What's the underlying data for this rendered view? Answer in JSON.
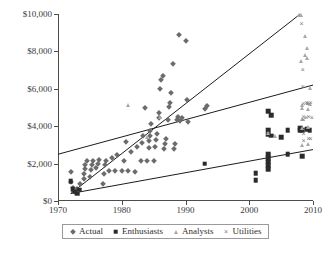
{
  "chart_data": {
    "type": "scatter",
    "title": "",
    "xlabel": "",
    "ylabel": "",
    "xlim": [
      1970,
      2010
    ],
    "ylim": [
      0,
      10000
    ],
    "xticks": [
      "1970",
      "1980",
      "1990",
      "2000",
      "2010"
    ],
    "yticks": [
      "$0",
      "$2,000",
      "$4,000",
      "$6,000",
      "$8,000",
      "$10,000"
    ],
    "xtick_values": [
      1970,
      1980,
      1990,
      2000,
      2010
    ],
    "ytick_values": [
      0,
      2000,
      4000,
      6000,
      8000,
      10000
    ],
    "grid": false,
    "legend_position": "bottom",
    "series": [
      {
        "name": "Actual",
        "marker": "diamond",
        "color": "#6b6b6b",
        "points": [
          [
            1972,
            1550
          ],
          [
            1972,
            1000
          ],
          [
            1972.4,
            700
          ],
          [
            1972.6,
            500
          ],
          [
            1973,
            620
          ],
          [
            1973.4,
            900
          ],
          [
            1974,
            1150
          ],
          [
            1974,
            1450
          ],
          [
            1974.2,
            1700
          ],
          [
            1974.3,
            1950
          ],
          [
            1974.5,
            2150
          ],
          [
            1975,
            1300
          ],
          [
            1975.2,
            1650
          ],
          [
            1975.4,
            1900
          ],
          [
            1975.5,
            2150
          ],
          [
            1976,
            1750
          ],
          [
            1976.2,
            2000
          ],
          [
            1976.4,
            2200
          ],
          [
            1977,
            900
          ],
          [
            1977.2,
            1450
          ],
          [
            1977.4,
            1900
          ],
          [
            1977.5,
            2150
          ],
          [
            1978,
            1600
          ],
          [
            1978.5,
            2300
          ],
          [
            1979,
            1600
          ],
          [
            1979.3,
            2450
          ],
          [
            1980,
            1600
          ],
          [
            1980.4,
            2150
          ],
          [
            1980.6,
            3150
          ],
          [
            1981,
            1600
          ],
          [
            1981.5,
            2600
          ],
          [
            1982,
            1550
          ],
          [
            1982.4,
            2900
          ],
          [
            1983,
            2150
          ],
          [
            1983.2,
            3100
          ],
          [
            1983.4,
            3450
          ],
          [
            1983.6,
            5000
          ],
          [
            1984,
            2150
          ],
          [
            1984.2,
            2850
          ],
          [
            1984.3,
            3200
          ],
          [
            1984.4,
            3500
          ],
          [
            1984.5,
            3750
          ],
          [
            1984.6,
            4100
          ],
          [
            1985,
            2150
          ],
          [
            1985.2,
            2900
          ],
          [
            1985.4,
            3250
          ],
          [
            1985.6,
            3600
          ],
          [
            1985.8,
            4450
          ],
          [
            1985.9,
            4700
          ],
          [
            1986,
            6000
          ],
          [
            1986.2,
            6450
          ],
          [
            1986.4,
            6700
          ],
          [
            1986.6,
            2800
          ],
          [
            1986.8,
            3050
          ],
          [
            1987,
            3300
          ],
          [
            1987.2,
            4350
          ],
          [
            1987.4,
            5050
          ],
          [
            1987.6,
            5250
          ],
          [
            1987.8,
            5750
          ],
          [
            1988,
            7300
          ],
          [
            1988.2,
            2800
          ],
          [
            1988.4,
            3050
          ],
          [
            1988.6,
            4350
          ],
          [
            1988.8,
            4500
          ],
          [
            1989,
            8900
          ],
          [
            1989.2,
            4300
          ],
          [
            1989.4,
            4450
          ],
          [
            1990,
            8550
          ],
          [
            1990.2,
            5400
          ],
          [
            1990.4,
            4200
          ],
          [
            1993,
            4900
          ],
          [
            1993.4,
            5100
          ]
        ]
      },
      {
        "name": "Enthusiasts",
        "marker": "square",
        "color": "#2b2b2b",
        "points": [
          [
            1972,
            1050
          ],
          [
            1972.3,
            620
          ],
          [
            1972.6,
            500
          ],
          [
            1973,
            400
          ],
          [
            1973.3,
            600
          ],
          [
            1993,
            2000
          ],
          [
            2001,
            1500
          ],
          [
            2001,
            1100
          ],
          [
            2003,
            4800
          ],
          [
            2003,
            3800
          ],
          [
            2003,
            3550
          ],
          [
            2003,
            2500
          ],
          [
            2003,
            2300
          ],
          [
            2003,
            2100
          ],
          [
            2003,
            1900
          ],
          [
            2003,
            1700
          ],
          [
            2003.4,
            4600
          ],
          [
            2003.4,
            3500
          ],
          [
            2005,
            3400
          ],
          [
            2006,
            3800
          ],
          [
            2006,
            2500
          ],
          [
            2008,
            3900
          ],
          [
            2008,
            3800
          ],
          [
            2008.3,
            3800
          ],
          [
            2008.3,
            2400
          ],
          [
            2009,
            3850
          ],
          [
            2009.5,
            3800
          ]
        ]
      },
      {
        "name": "Analysts",
        "marker": "triangle",
        "color": "#a8a8a8",
        "points": [
          [
            1981,
            5150
          ],
          [
            1984,
            3400
          ],
          [
            1986,
            4500
          ],
          [
            2003,
            3650
          ],
          [
            2004,
            3500
          ],
          [
            2007.8,
            9950
          ],
          [
            2008.1,
            9950
          ],
          [
            2008.1,
            7500
          ],
          [
            2008.3,
            5150
          ],
          [
            2008.3,
            4950
          ],
          [
            2008.3,
            4400
          ],
          [
            2008.3,
            3900
          ],
          [
            2008.3,
            3000
          ],
          [
            2008.8,
            8800
          ],
          [
            2008.8,
            7800
          ],
          [
            2009,
            8200
          ],
          [
            2009,
            7650
          ],
          [
            2009.2,
            5250
          ],
          [
            2009.2,
            4900
          ],
          [
            2009.2,
            3950
          ],
          [
            2009.2,
            3050
          ],
          [
            2009.5,
            6050
          ],
          [
            2009.5,
            5200
          ]
        ]
      },
      {
        "name": "Utilities",
        "marker": "cross",
        "color": "#7d7d7d",
        "points": [
          [
            2008.2,
            9450
          ],
          [
            2008.4,
            7000
          ],
          [
            2008.4,
            6100
          ],
          [
            2008.5,
            5200
          ],
          [
            2008.5,
            4500
          ],
          [
            2008.5,
            4350
          ],
          [
            2008.5,
            3600
          ],
          [
            2008.5,
            3200
          ],
          [
            2008.9,
            4450
          ],
          [
            2009,
            5250
          ],
          [
            2009.1,
            5200
          ],
          [
            2009.3,
            4500
          ],
          [
            2009.3,
            3300
          ],
          [
            2009.6,
            5250
          ],
          [
            2009.6,
            3300
          ],
          [
            2009.8,
            4450
          ]
        ]
      }
    ],
    "trend_lines": [
      {
        "name": "steep-trend",
        "x1": 1972,
        "y1": 400,
        "x2": 2008,
        "y2": 10000
      },
      {
        "name": "middle-trend",
        "x1": 1970,
        "y1": 2500,
        "x2": 2010,
        "y2": 6200
      },
      {
        "name": "lower-trend",
        "x1": 1972,
        "y1": 400,
        "x2": 2010,
        "y2": 2750
      }
    ]
  },
  "legend": {
    "items": [
      {
        "label": "Actual",
        "marker": "diamond"
      },
      {
        "label": "Enthusiasts",
        "marker": "square"
      },
      {
        "label": "Analysts",
        "marker": "triangle"
      },
      {
        "label": "Utilities",
        "marker": "cross"
      }
    ]
  }
}
